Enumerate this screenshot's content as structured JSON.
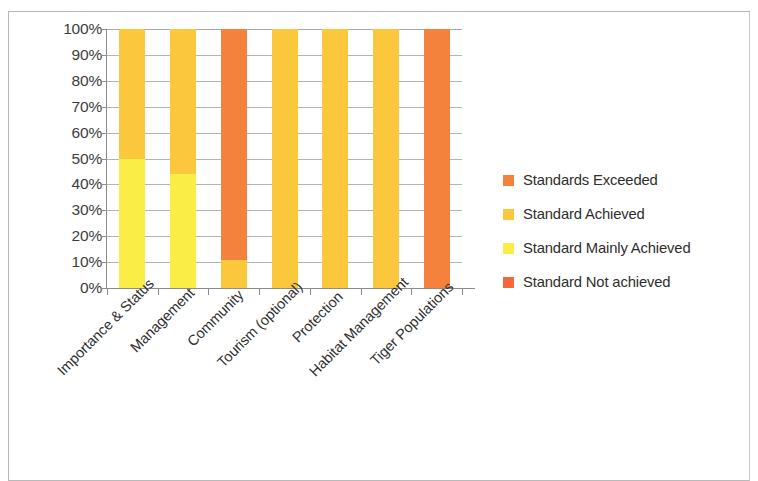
{
  "chart_data": {
    "type": "bar",
    "subtype": "100% stacked column",
    "title": "",
    "xlabel": "",
    "ylabel": "",
    "ylim": [
      0,
      100
    ],
    "grid": true,
    "legend_position": "right",
    "categories": [
      "Importance & Status",
      "Management",
      "Community",
      "Tourism (optional)",
      "Protection",
      "Habitat Management",
      "Tiger Populations"
    ],
    "y_ticks": [
      "0%",
      "10%",
      "20%",
      "30%",
      "40%",
      "50%",
      "60%",
      "70%",
      "80%",
      "90%",
      "100%"
    ],
    "y_tick_values": [
      0,
      10,
      20,
      30,
      40,
      50,
      60,
      70,
      80,
      90,
      100
    ],
    "series": [
      {
        "name": "Standard Mainly Achieved",
        "color": "#FAEE46",
        "values": [
          50,
          44,
          0,
          0,
          0,
          0,
          0
        ]
      },
      {
        "name": "Standard Achieved",
        "color": "#FBC73C",
        "values": [
          50,
          56,
          11,
          100,
          100,
          100,
          0
        ]
      },
      {
        "name": "Standards Exceeded",
        "color": "#F4813C",
        "values": [
          0,
          0,
          89,
          0,
          0,
          0,
          100
        ]
      },
      {
        "name": "Standard Not achieved",
        "color": "#F4683C",
        "values": [
          0,
          0,
          0,
          0,
          0,
          0,
          0
        ]
      }
    ],
    "stacks": [
      {
        "category": "Importance & Status",
        "segments": [
          {
            "series": "Standard Mainly Achieved",
            "value": 50,
            "color": "#FAEE46"
          },
          {
            "series": "Standard Achieved",
            "value": 50,
            "color": "#FBC73C"
          }
        ]
      },
      {
        "category": "Management",
        "segments": [
          {
            "series": "Standard Mainly Achieved",
            "value": 44,
            "color": "#FAEE46"
          },
          {
            "series": "Standard Achieved",
            "value": 56,
            "color": "#FBC73C"
          }
        ]
      },
      {
        "category": "Community",
        "segments": [
          {
            "series": "Standard Achieved",
            "value": 11,
            "color": "#FBC73C"
          },
          {
            "series": "Standards Exceeded",
            "value": 89,
            "color": "#F4813C"
          }
        ]
      },
      {
        "category": "Tourism (optional)",
        "segments": [
          {
            "series": "Standard Achieved",
            "value": 100,
            "color": "#FBC73C"
          }
        ]
      },
      {
        "category": "Protection",
        "segments": [
          {
            "series": "Standard Achieved",
            "value": 100,
            "color": "#FBC73C"
          }
        ]
      },
      {
        "category": "Habitat Management",
        "segments": [
          {
            "series": "Standard Achieved",
            "value": 100,
            "color": "#FBC73C"
          }
        ]
      },
      {
        "category": "Tiger Populations",
        "segments": [
          {
            "series": "Standards Exceeded",
            "value": 100,
            "color": "#F4813C"
          }
        ]
      }
    ]
  },
  "legend": {
    "items": [
      {
        "label": "Standards Exceeded",
        "color": "#F4813C"
      },
      {
        "label": "Standard Achieved",
        "color": "#FBC73C"
      },
      {
        "label": "Standard Mainly Achieved",
        "color": "#FAEE46"
      },
      {
        "label": "Standard Not achieved",
        "color": "#F4683C"
      }
    ]
  },
  "colors": {
    "standards_exceeded": "#F4813C",
    "standard_achieved": "#FBC73C",
    "standard_mainly_achieved": "#FAEE46",
    "standard_not_achieved": "#F4683C",
    "gridline": "#9A9A9A",
    "axis": "#8C8C8C",
    "text": "#2F2F2F",
    "frame": "#B9B9B9",
    "background": "#FFFFFF"
  }
}
